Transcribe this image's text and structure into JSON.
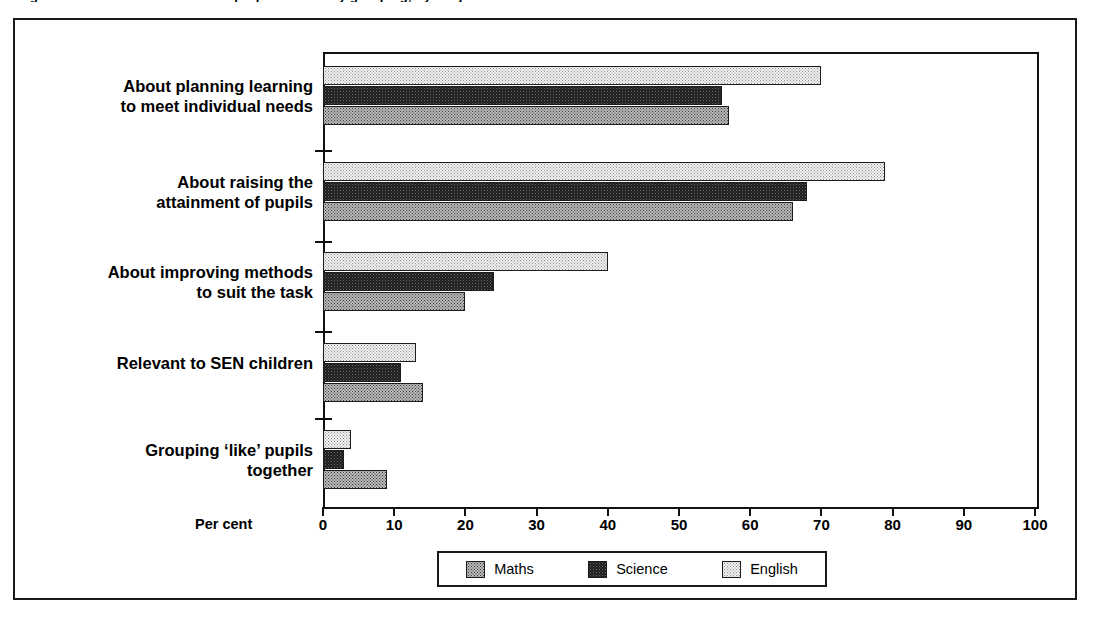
{
  "figure": {
    "caption": "Figure 3.1  Teachers' views on the purpose of ability grouping, by subject"
  },
  "legend": {
    "position": "bottom-center",
    "items": [
      {
        "label": "Maths",
        "key": "maths",
        "pattern": "medium-gray-dither"
      },
      {
        "label": "Science",
        "key": "science",
        "pattern": "dark-dither"
      },
      {
        "label": "English",
        "key": "english",
        "pattern": "light-dither"
      }
    ]
  },
  "axis": {
    "x_label": "Per cent",
    "ticks": [
      "0",
      "10",
      "20",
      "30",
      "40",
      "50",
      "60",
      "70",
      "80",
      "90",
      "100"
    ],
    "min": 0,
    "max": 100,
    "step": 10
  },
  "chart_data": {
    "type": "bar",
    "orientation": "horizontal",
    "title": "Teachers' views on the purpose of ability grouping, by subject",
    "xlabel": "Per cent",
    "ylabel": "",
    "xlim": [
      0,
      100
    ],
    "grid": false,
    "legend_position": "bottom-center",
    "categories": [
      "About planning learning\nto meet individual needs",
      "About raising the\nattainment of pupils",
      "About improving methods\nto suit the task",
      "Relevant to SEN children",
      "Grouping ‘like’ pupils\ntogether"
    ],
    "series": [
      {
        "name": "English",
        "values": [
          70,
          79,
          40,
          13,
          4
        ]
      },
      {
        "name": "Science",
        "values": [
          56,
          68,
          24,
          11,
          3
        ]
      },
      {
        "name": "Maths",
        "values": [
          57,
          66,
          20,
          14,
          9
        ]
      }
    ]
  },
  "colors": {
    "ink": "#1a1a1a",
    "english_fill": "#f2f2f2",
    "science_fill": "#1b1b1b",
    "maths_fill": "#b9b9b9",
    "background": "#ffffff"
  }
}
